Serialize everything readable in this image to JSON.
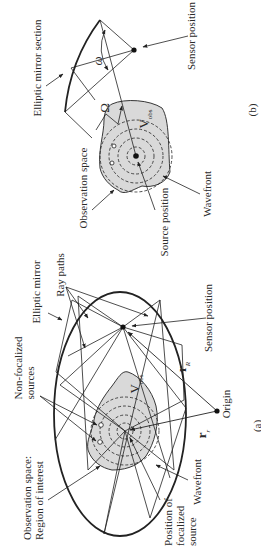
{
  "figure": {
    "panel_b": {
      "caption": "(b)",
      "labels": {
        "mirror_section": "Elliptic mirror section",
        "sensor_position": "Sensor position",
        "observation_space": "Observation space",
        "source_position": "Source position",
        "wavefront": "Wavefront"
      },
      "symbols": {
        "omega_small": "ω",
        "omega_large": "Ω",
        "v_obs_main": "V",
        "v_obs_sub": "obs"
      }
    },
    "panel_a": {
      "caption": "(a)",
      "labels": {
        "elliptic_mirror": "Elliptic mirror",
        "ray_paths": "Ray paths",
        "sensor_position": "Sensor position",
        "non_focalized_sources": "Non-focalized\nsources",
        "observation_space": "Observation space:\nRegion of interest",
        "wavefront": "Wavefront",
        "focalized_source": "Position of\nfocalized\nsource",
        "origin": "Origin"
      },
      "symbols": {
        "r_R_main": "r",
        "r_R_sub": "R",
        "r_r_main": "r",
        "r_r_sub": "r",
        "v_obs_main": "V",
        "v_obs_sub": "obs"
      }
    },
    "colors": {
      "line": "#222222",
      "blob_fill": "#d9d9d9",
      "background": "#ffffff"
    }
  }
}
